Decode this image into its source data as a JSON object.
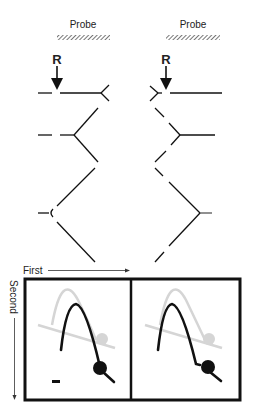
{
  "top": {
    "left": {
      "probe_label": "Probe",
      "site_label": "R"
    },
    "right": {
      "probe_label": "Probe",
      "site_label": "R"
    }
  },
  "bottom": {
    "axis_first_label": "First",
    "axis_second_label": "Second",
    "panels": [
      {
        "name": "left-panel",
        "features": [
          "faint-gray-arc",
          "black-arc",
          "black-spot",
          "short-bar"
        ]
      },
      {
        "name": "right-panel",
        "features": [
          "faint-gray-arc",
          "black-arc",
          "black-spot"
        ]
      }
    ]
  },
  "colors": {
    "ink": "#111111",
    "faint": "#d8d8d8",
    "hatch": "#666666",
    "background": "#ffffff"
  }
}
